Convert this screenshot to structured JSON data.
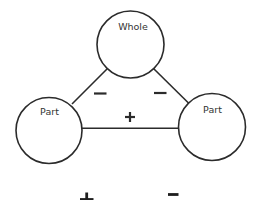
{
  "diagram": {
    "type": "number-bond triangle",
    "nodes": [
      {
        "id": "whole",
        "label": "Whole",
        "cx": 130.5,
        "cy": 44.5,
        "r": 33.5
      },
      {
        "id": "part_left",
        "label": "Part",
        "cx": 49,
        "cy": 130.5,
        "r": 33
      },
      {
        "id": "part_right",
        "label": "Part",
        "cx": 212,
        "cy": 127,
        "r": 33.5
      }
    ],
    "edges": [
      {
        "from": "whole",
        "to": "part_left",
        "sign": "−"
      },
      {
        "from": "whole",
        "to": "part_right",
        "sign": "−"
      },
      {
        "from": "part_left",
        "to": "part_right",
        "sign": "+"
      }
    ],
    "legend": {
      "plus": "+",
      "minus": "−"
    },
    "colors": {
      "stroke": "#2b2b2b",
      "background": "#ffffff"
    }
  }
}
